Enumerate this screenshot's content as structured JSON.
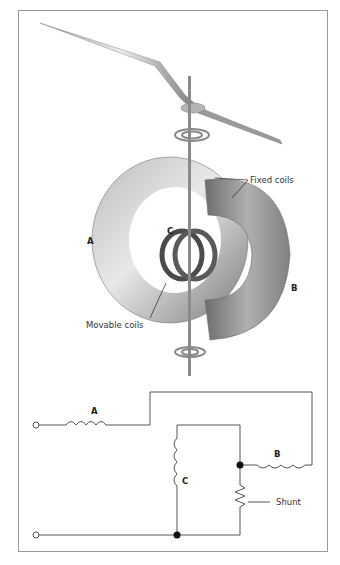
{
  "figure": {
    "type": "Electrodynamometer instrument with circuit",
    "labels": {
      "fixed_coils": "Fixed coils",
      "movable_coils": "Movable coils",
      "coil_a": "A",
      "coil_b": "B",
      "coil_c": "C"
    },
    "circuit": {
      "inductor_a": "A",
      "inductor_b": "B",
      "inductor_c": "C",
      "shunt": "Shunt"
    }
  },
  "colors": {
    "frame": "#9a9a9a",
    "wire": "#555555",
    "coil": "#8c8c8c",
    "movable_coil": "#4a4a4a"
  }
}
